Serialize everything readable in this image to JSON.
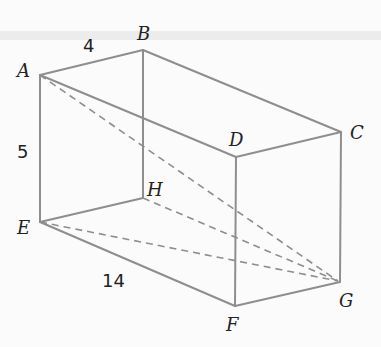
{
  "figure": {
    "type": "rectangular prism with space diagonals",
    "vertices": {
      "A": {
        "label": "A",
        "x": 40,
        "y": 75
      },
      "B": {
        "label": "B",
        "x": 143,
        "y": 50
      },
      "C": {
        "label": "C",
        "x": 341,
        "y": 132
      },
      "D": {
        "label": "D",
        "x": 236,
        "y": 157
      },
      "E": {
        "label": "E",
        "x": 40,
        "y": 222
      },
      "F": {
        "label": "F",
        "x": 235,
        "y": 306
      },
      "G": {
        "label": "G",
        "x": 340,
        "y": 282
      },
      "H": {
        "label": "H",
        "x": 143,
        "y": 198
      }
    },
    "dimensions": {
      "AB": "4",
      "AE": "5",
      "EF": "14"
    },
    "dashed_lines": [
      "AG",
      "EG",
      "HG",
      "BG"
    ]
  }
}
